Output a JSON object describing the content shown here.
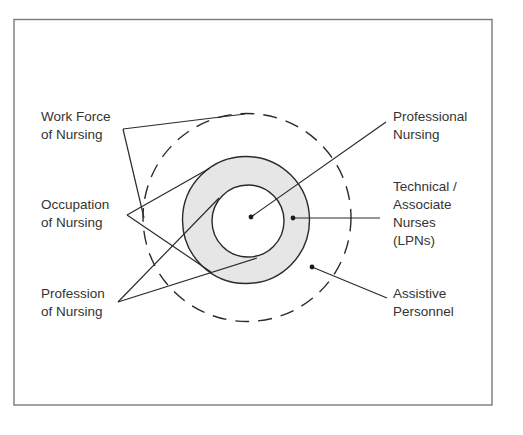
{
  "diagram": {
    "type": "nested-circles",
    "labels_left": [
      {
        "id": "work-force",
        "lines": [
          "Work Force",
          "of Nursing"
        ]
      },
      {
        "id": "occupation",
        "lines": [
          "Occupation",
          "of Nursing"
        ]
      },
      {
        "id": "profession",
        "lines": [
          "Profession",
          "of Nursing"
        ]
      }
    ],
    "labels_right": [
      {
        "id": "professional-nursing",
        "lines": [
          "Professional",
          "Nursing"
        ]
      },
      {
        "id": "technical-associate",
        "lines": [
          "Technical /",
          "Associate",
          "Nurses",
          "(LPNs)"
        ]
      },
      {
        "id": "assistive-personnel",
        "lines": [
          "Assistive",
          "Personnel"
        ]
      }
    ],
    "circles": [
      {
        "id": "inner",
        "represents": "Professional Nursing",
        "style": "solid",
        "fill": "#ffffff"
      },
      {
        "id": "middle-ring",
        "represents": "Technical / Associate Nurses (LPNs)",
        "style": "solid",
        "fill": "#e6e6e6"
      },
      {
        "id": "outer",
        "represents": "Assistive Personnel",
        "style": "dashed",
        "fill": "none"
      }
    ],
    "relationships": [
      {
        "label": "work-force",
        "encloses": "outer"
      },
      {
        "label": "occupation",
        "encloses": "middle-ring"
      },
      {
        "label": "profession",
        "encloses": "inner"
      }
    ]
  }
}
